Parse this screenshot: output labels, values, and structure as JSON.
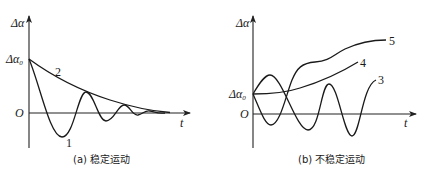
{
  "panels": [
    {
      "id": "a",
      "caption": "(a) 稳定运动",
      "y_axis_label": "Δα",
      "x_axis_label": "t",
      "origin_label": "O",
      "initial_label": "Δα",
      "initial_subscript": "0",
      "curves": [
        {
          "label": "1",
          "description": "damped oscillation decaying to zero"
        },
        {
          "label": "2",
          "description": "monotonic decay to zero"
        }
      ]
    },
    {
      "id": "b",
      "caption": "(b) 不稳定运动",
      "y_axis_label": "Δα",
      "x_axis_label": "t",
      "origin_label": "O",
      "initial_label": "Δα",
      "initial_subscript": "0",
      "curves": [
        {
          "label": "3",
          "description": "growing oscillation"
        },
        {
          "label": "4",
          "description": "monotonic divergence"
        },
        {
          "label": "5",
          "description": "oscillatory divergence"
        }
      ]
    }
  ]
}
